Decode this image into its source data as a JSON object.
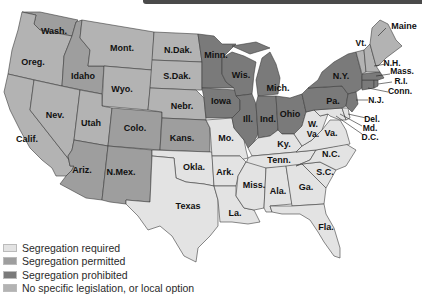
{
  "colors": {
    "required": "#e3e3e3",
    "permitted": "#9e9e9e",
    "prohibited": "#7a7a7a",
    "none": "#b3b3b3",
    "border": "#3c3c3c",
    "header_bar": "#4a4a4a"
  },
  "legend": [
    {
      "key": "required",
      "label": "Segregation required"
    },
    {
      "key": "permitted",
      "label": "Segregation permitted"
    },
    {
      "key": "prohibited",
      "label": "Segregation prohibited"
    },
    {
      "key": "none",
      "label": "No specific legislation, or local option"
    }
  ],
  "states": {
    "wash": {
      "label": "Wash.",
      "category": "permitted"
    },
    "oreg": {
      "label": "Oreg.",
      "category": "none"
    },
    "calif": {
      "label": "Calif.",
      "category": "none"
    },
    "idaho": {
      "label": "Idaho",
      "category": "permitted"
    },
    "nev": {
      "label": "Nev.",
      "category": "none"
    },
    "mont": {
      "label": "Mont.",
      "category": "none"
    },
    "wyo": {
      "label": "Wyo.",
      "category": "none"
    },
    "utah": {
      "label": "Utah",
      "category": "none"
    },
    "colo": {
      "label": "Colo.",
      "category": "permitted"
    },
    "ariz": {
      "label": "Ariz.",
      "category": "permitted"
    },
    "nmex": {
      "label": "N.Mex.",
      "category": "permitted"
    },
    "ndak": {
      "label": "N.Dak.",
      "category": "none"
    },
    "sdak": {
      "label": "S.Dak.",
      "category": "none"
    },
    "nebr": {
      "label": "Nebr.",
      "category": "none"
    },
    "kans": {
      "label": "Kans.",
      "category": "permitted"
    },
    "okla": {
      "label": "Okla.",
      "category": "required"
    },
    "texas": {
      "label": "Texas",
      "category": "required"
    },
    "minn": {
      "label": "Minn.",
      "category": "prohibited"
    },
    "iowa": {
      "label": "Iowa",
      "category": "prohibited"
    },
    "mo": {
      "label": "Mo.",
      "category": "required"
    },
    "ark": {
      "label": "Ark.",
      "category": "required"
    },
    "la": {
      "label": "La.",
      "category": "required"
    },
    "wis": {
      "label": "Wis.",
      "category": "prohibited"
    },
    "ill": {
      "label": "Ill.",
      "category": "prohibited"
    },
    "mich": {
      "label": "Mich.",
      "category": "prohibited"
    },
    "ind": {
      "label": "Ind.",
      "category": "prohibited"
    },
    "ohio": {
      "label": "Ohio",
      "category": "prohibited"
    },
    "ky": {
      "label": "Ky.",
      "category": "required"
    },
    "tenn": {
      "label": "Tenn.",
      "category": "required"
    },
    "miss": {
      "label": "Miss.",
      "category": "required"
    },
    "ala": {
      "label": "Ala.",
      "category": "required"
    },
    "ga": {
      "label": "Ga.",
      "category": "required"
    },
    "fla": {
      "label": "Fla.",
      "category": "required"
    },
    "sc": {
      "label": "S.C.",
      "category": "required"
    },
    "nc": {
      "label": "N.C.",
      "category": "required"
    },
    "va": {
      "label": "Va.",
      "category": "required"
    },
    "wva_1": {
      "label": "W.",
      "category": "required"
    },
    "wva_2": {
      "label": "Va.",
      "category": "required"
    },
    "md": {
      "label": "Md.",
      "category": "required"
    },
    "del": {
      "label": "Del.",
      "category": "required"
    },
    "dc": {
      "label": "D.C.",
      "category": "required"
    },
    "pa": {
      "label": "Pa.",
      "category": "prohibited"
    },
    "ny": {
      "label": "N.Y.",
      "category": "prohibited"
    },
    "nj": {
      "label": "N.J.",
      "category": "prohibited"
    },
    "conn": {
      "label": "Conn.",
      "category": "prohibited"
    },
    "ri": {
      "label": "R.I.",
      "category": "prohibited"
    },
    "mass": {
      "label": "Mass.",
      "category": "prohibited"
    },
    "vt": {
      "label": "Vt.",
      "category": "none"
    },
    "nh": {
      "label": "N.H.",
      "category": "none"
    },
    "maine": {
      "label": "Maine",
      "category": "none"
    }
  }
}
